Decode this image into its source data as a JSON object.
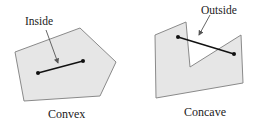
{
  "figures": [
    {
      "caption": "Convex",
      "annotation": "Inside",
      "polygon": [
        [
          15,
          52
        ],
        [
          80,
          28
        ],
        [
          116,
          62
        ],
        [
          100,
          96
        ],
        [
          24,
          101
        ]
      ],
      "segment": [
        [
          38,
          73
        ],
        [
          83,
          61
        ]
      ],
      "arrow": {
        "from": [
          46,
          30
        ],
        "to": [
          58,
          63
        ]
      }
    },
    {
      "caption": "Concave",
      "annotation": "Outside",
      "polygon": [
        [
          155,
          35
        ],
        [
          186,
          22
        ],
        [
          190,
          67
        ],
        [
          241,
          35
        ],
        [
          243,
          83
        ],
        [
          156,
          98
        ]
      ],
      "segment": [
        [
          178,
          37
        ],
        [
          234,
          54
        ]
      ],
      "arrow": {
        "from": [
          210,
          15
        ],
        "to": [
          199,
          35
        ]
      }
    }
  ],
  "colors": {
    "fill": "#e6e6e6",
    "stroke": "#8a8a8a",
    "line": "#111111",
    "arrow": "#555555"
  }
}
